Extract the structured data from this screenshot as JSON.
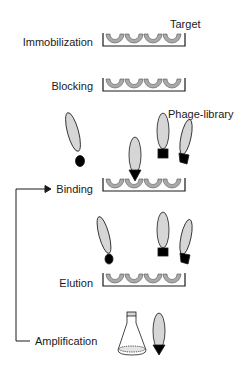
{
  "diagram": {
    "annotations": {
      "target": "Target",
      "phage_library": "Phage-library"
    },
    "steps": [
      {
        "label": "Immobilization"
      },
      {
        "label": "Blocking"
      },
      {
        "label": "Binding"
      },
      {
        "label": "Elution"
      },
      {
        "label": "Amplification"
      }
    ],
    "colors": {
      "well_fill": "#a9a9a9",
      "phage_fill": "#d6d6d6",
      "outline": "#1a1a1a",
      "tip": "#000000"
    }
  }
}
